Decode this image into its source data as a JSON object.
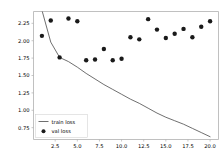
{
  "chart_data": {
    "type": "line",
    "title": "",
    "xlabel": "",
    "ylabel": "",
    "xlim": [
      0.05,
      20.95
    ],
    "ylim": [
      0.58,
      2.42
    ],
    "grid": false,
    "legend_position": "lower left",
    "x": [
      1,
      2,
      3,
      4,
      5,
      6,
      7,
      8,
      9,
      10,
      11,
      12,
      13,
      14,
      15,
      16,
      17,
      18,
      19,
      20
    ],
    "xticks": [
      2.5,
      5.0,
      7.5,
      10.0,
      12.5,
      15.0,
      17.5,
      20.0
    ],
    "xtick_labels": [
      "2.5",
      "5.0",
      "7.5",
      "10.0",
      "12.5",
      "15.0",
      "17.5",
      "20.0"
    ],
    "yticks": [
      0.75,
      1.0,
      1.25,
      1.5,
      1.75,
      2.0,
      2.25
    ],
    "ytick_labels": [
      "0.75",
      "1.00",
      "1.25",
      "1.50",
      "1.75",
      "2.00",
      "2.25"
    ],
    "series": [
      {
        "name": "train loss",
        "style": "line",
        "color": "#4a4a4a",
        "values": [
          2.44,
          1.98,
          1.76,
          1.7,
          1.62,
          1.53,
          1.45,
          1.37,
          1.3,
          1.23,
          1.16,
          1.1,
          1.03,
          0.96,
          0.9,
          0.85,
          0.8,
          0.74,
          0.68,
          0.62
        ]
      },
      {
        "name": "val loss",
        "style": "scatter",
        "color": "#1a1a1a",
        "values": [
          2.07,
          2.29,
          1.76,
          2.32,
          2.28,
          1.72,
          1.73,
          1.88,
          1.72,
          1.74,
          2.05,
          2.02,
          2.31,
          2.16,
          2.04,
          2.1,
          2.17,
          2.05,
          2.2,
          2.28
        ]
      }
    ],
    "legend_entries": [
      {
        "label": "train loss",
        "marker": "line"
      },
      {
        "label": "val loss",
        "marker": "dot"
      }
    ]
  }
}
